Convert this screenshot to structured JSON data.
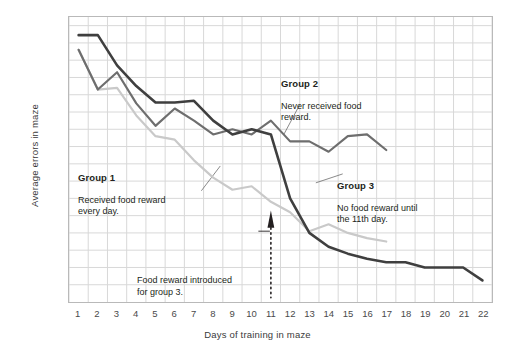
{
  "chart_data": {
    "type": "line",
    "title": "",
    "xlabel": "Days of training in maze",
    "ylabel": "Average errors in maze",
    "xlim": [
      0.5,
      22.5
    ],
    "ylim": [
      0,
      33
    ],
    "grid": true,
    "legend_position": "inline-annotations",
    "xticks": [
      1,
      2,
      3,
      4,
      5,
      6,
      7,
      8,
      9,
      10,
      11,
      12,
      13,
      14,
      15,
      16,
      17,
      18,
      19,
      20,
      21,
      22
    ],
    "yticks": [
      2,
      4,
      6,
      8,
      10,
      12,
      14,
      16,
      18,
      20,
      22,
      24,
      26,
      28,
      30,
      32
    ],
    "series": [
      {
        "name": "Group 1",
        "color": "#c9c9c9",
        "x": [
          1,
          2,
          3,
          4,
          5,
          6,
          7,
          8,
          9,
          10,
          11,
          12,
          13,
          14,
          15,
          16,
          17
        ],
        "values": [
          29.2,
          24.6,
          24.8,
          21.6,
          19.2,
          18.8,
          16.4,
          14.4,
          13.0,
          13.4,
          11.6,
          10.4,
          8.2,
          9.0,
          8.0,
          7.4,
          7.0
        ]
      },
      {
        "name": "Group 2",
        "color": "#6e6e6e",
        "x": [
          1,
          2,
          3,
          4,
          5,
          6,
          7,
          8,
          9,
          10,
          11,
          12,
          13,
          14,
          15,
          16,
          17
        ],
        "values": [
          29.2,
          24.6,
          26.6,
          23.0,
          20.4,
          22.4,
          21.0,
          19.4,
          20.0,
          19.4,
          21.0,
          18.6,
          18.6,
          17.4,
          19.2,
          19.4,
          17.6
        ]
      },
      {
        "name": "Group 3",
        "color": "#3f3f3f",
        "x": [
          1,
          2,
          3,
          4,
          5,
          6,
          7,
          8,
          9,
          10,
          11,
          12,
          13,
          14,
          15,
          16,
          17,
          18,
          19,
          20,
          21,
          22
        ],
        "values": [
          30.9,
          30.9,
          27.4,
          25.0,
          23.1,
          23.1,
          23.3,
          21.0,
          19.4,
          20.0,
          19.4,
          12.0,
          8.0,
          6.4,
          5.6,
          5.0,
          4.6,
          4.6,
          4.0,
          4.0,
          4.0,
          2.5
        ]
      }
    ],
    "annotations": [
      {
        "id": "group1",
        "title": "Group 1",
        "text": "Received food reward\never                y day."
      },
      {
        "id": "group2",
        "title": "Group 2",
        "text": "Never received food\nreward."
      },
      {
        "id": "group3",
        "title": "Group 3",
        "text": "No food reward until\nthe 11th day."
      },
      {
        "id": "food-introduced",
        "text": "Food reward introduced\nfor group 3.",
        "at_x": 11
      }
    ]
  },
  "axes": {
    "ylabel": "Average errors in maze",
    "xlabel": "Days of training in maze"
  },
  "annotations": {
    "group1": {
      "title": "Group 1",
      "body": "Received food reward\nevery day."
    },
    "group2": {
      "title": "Group 2",
      "body": "Never received food\nreward."
    },
    "group3": {
      "title": "Group 3",
      "body": "No food reward until\nthe 11th day."
    },
    "food_introduced": "Food reward introduced\nfor group 3."
  },
  "colors": {
    "group1": "#c9c9c9",
    "group2": "#6e6e6e",
    "group3": "#3f3f3f",
    "grid": "#d8d8d8",
    "frame": "#b9b9b9",
    "text": "#231f20"
  }
}
